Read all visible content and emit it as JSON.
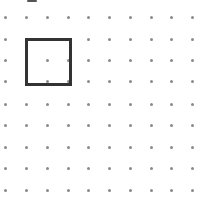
{
  "grid": {
    "columns_x": [
      5,
      26,
      47,
      68,
      88,
      109,
      130,
      151,
      171,
      192
    ],
    "rows_y": [
      17,
      39,
      60,
      81,
      104,
      125,
      147,
      168,
      190
    ],
    "dot_color": "#8a8a8a"
  },
  "square": {
    "left": 25,
    "top": 38,
    "width": 41,
    "height": 42,
    "stroke_color": "#333333",
    "stroke_width": 3
  }
}
